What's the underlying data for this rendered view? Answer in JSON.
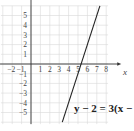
{
  "chart_data": {
    "type": "line",
    "title": "",
    "xlabel": "x",
    "ylabel": "",
    "xlim": [
      -3,
      8.5
    ],
    "ylim": [
      -6,
      6
    ],
    "grid": true,
    "x_tick_labels": [
      "-2",
      "-1",
      "1",
      "2",
      "3",
      "4",
      "5",
      "6",
      "7",
      "8"
    ],
    "y_tick_labels": [
      "5",
      "4",
      "3",
      "2",
      "1",
      "-1",
      "-2",
      "-3",
      "-4",
      "-5"
    ],
    "series": [
      {
        "name": "y - 2 = 3(x - 6)",
        "equation": "y - 2 = 3(x - 6)",
        "slope": 3,
        "point": [
          6,
          2
        ],
        "x": [
          3.33,
          7.33
        ],
        "y": [
          -6,
          6
        ]
      }
    ],
    "annotations": [
      {
        "text": "y − 2 = 3(x − 6",
        "position": "lower-right"
      }
    ]
  },
  "labels": {
    "x_axis": "x",
    "equation": "y − 2 = 3(x − 6"
  },
  "colors": {
    "grid": "#d9d9d9",
    "axis": "#333333",
    "line": "#222222",
    "text": "#444444"
  }
}
